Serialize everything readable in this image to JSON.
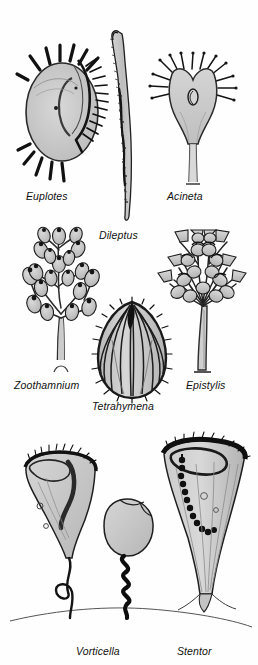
{
  "plate": {
    "title": "Ciliate protozoa illustration plate",
    "background_color": "#fefefe",
    "ink_color": "#1a1a1a",
    "body_fill_color": "#c9c9c9",
    "width": 258,
    "height": 665
  },
  "organisms": [
    {
      "id": "euplotes",
      "label": "Euplotes",
      "row": 1,
      "column": 1,
      "description": "oval hypotrich ciliate with stout cirri",
      "label_x": 26,
      "label_y": 190
    },
    {
      "id": "dileptus",
      "label": "Dileptus",
      "row": 1,
      "column": 2,
      "description": "elongate ciliate with curved proboscis",
      "label_x": 99,
      "label_y": 229
    },
    {
      "id": "acineta",
      "label": "Acineta",
      "row": 1,
      "column": 3,
      "description": "stalked suctorian with radiating tentacles",
      "label_x": 167,
      "label_y": 190
    },
    {
      "id": "zoothamnium",
      "label": "Zoothamnium",
      "row": 2,
      "column": 1,
      "description": "branched colonial peritrich with bell zooids",
      "label_x": 14,
      "label_y": 379
    },
    {
      "id": "tetrahymena",
      "label": "Tetrahymena",
      "row": 2,
      "column": 2,
      "description": "ovoid ciliate with longitudinal kineties",
      "label_x": 92,
      "label_y": 400
    },
    {
      "id": "epistylis",
      "label": "Epistylis",
      "row": 2,
      "column": 3,
      "description": "colonial peritrich on rigid branching stalk",
      "label_x": 186,
      "label_y": 379
    },
    {
      "id": "vorticella",
      "label": "Vorticella",
      "row": 3,
      "column": 1,
      "description": "bell-shaped peritrich with contractile coiled stalk",
      "label_x": 76,
      "label_y": 645
    },
    {
      "id": "stentor",
      "label": "Stentor",
      "row": 3,
      "column": 2,
      "description": "trumpet-shaped ciliate with beaded macronucleus",
      "label_x": 177,
      "label_y": 645
    }
  ]
}
